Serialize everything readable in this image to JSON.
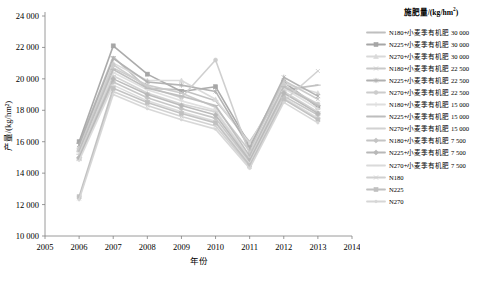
{
  "chart_data": {
    "type": "line",
    "title": "",
    "xlabel": "年份",
    "ylabel": "产量/(kg/hm²)",
    "xlim": [
      2005,
      2014
    ],
    "ylim": [
      10000,
      24000
    ],
    "ytick_labels": [
      "10 000",
      "12 000",
      "14 000",
      "16 000",
      "18 000",
      "20 000",
      "22 000",
      "24 000"
    ],
    "yticks": [
      10000,
      12000,
      14000,
      16000,
      18000,
      20000,
      22000,
      24000
    ],
    "xtick_labels": [
      "2005",
      "2006",
      "2007",
      "2008",
      "2009",
      "2010",
      "2011",
      "2012",
      "2013",
      "2014"
    ],
    "xticks": [
      2005,
      2006,
      2007,
      2008,
      2009,
      2010,
      2011,
      2012,
      2013,
      2014
    ],
    "grid": false,
    "legend_position": "right",
    "legend_title": "施肥量/(kg/hm²)",
    "x": [
      2006,
      2007,
      2008,
      2009,
      2010,
      2011,
      2012,
      2013
    ],
    "series": [
      {
        "name": "N180+小麦季有机肥 30 000",
        "color": "#bfbfbf",
        "marker": "dash",
        "values": [
          15900,
          21400,
          19400,
          19300,
          18600,
          16000,
          19300,
          19600
        ]
      },
      {
        "name": "N225+小麦季有机肥 30 000",
        "color": "#a6a6a6",
        "marker": "square",
        "values": [
          16000,
          22100,
          20300,
          19200,
          19500,
          15800,
          19800,
          18200
        ]
      },
      {
        "name": "N270+小麦季有机肥 30 000",
        "color": "#d9d9d9",
        "marker": "triangle",
        "values": [
          15700,
          21000,
          19900,
          19900,
          18700,
          15900,
          19700,
          19100
        ]
      },
      {
        "name": "N180+小麦季有机肥 22 500",
        "color": "#c9c9c9",
        "marker": "cross",
        "values": [
          15600,
          20700,
          19600,
          19100,
          18200,
          15400,
          19900,
          18700
        ]
      },
      {
        "name": "N225+小麦季有机肥 22 500",
        "color": "#b0b0b0",
        "marker": "star",
        "values": [
          15800,
          21300,
          19800,
          19600,
          19200,
          15600,
          20100,
          18900
        ]
      },
      {
        "name": "N270+小麦季有机肥 22 500",
        "color": "#cccccc",
        "marker": "circle",
        "values": [
          15500,
          20900,
          19500,
          18800,
          21200,
          15200,
          19600,
          18400
        ]
      },
      {
        "name": "N180+小麦季有机肥 15 000",
        "color": "#dedede",
        "marker": "plus",
        "values": [
          15300,
          20400,
          19300,
          18600,
          18000,
          15000,
          19400,
          18100
        ]
      },
      {
        "name": "N225+小麦季有机肥 15 000",
        "color": "#bdbdbd",
        "marker": "dash",
        "values": [
          15400,
          20600,
          19400,
          18900,
          18300,
          15100,
          19500,
          18300
        ]
      },
      {
        "name": "N270+小麦季有机肥 15 000",
        "color": "#d2d2d2",
        "marker": "dash",
        "values": [
          15200,
          20200,
          19100,
          18400,
          17900,
          14900,
          19200,
          17900
        ]
      },
      {
        "name": "N180+小麦季有机肥 7 500",
        "color": "#c4c4c4",
        "marker": "diamond",
        "values": [
          14900,
          19800,
          18800,
          18100,
          17500,
          14700,
          18900,
          17700
        ]
      },
      {
        "name": "N225+小麦季有机肥 7 500",
        "color": "#b8b8b8",
        "marker": "diamond",
        "values": [
          15000,
          20000,
          19000,
          18300,
          17700,
          14800,
          19100,
          17800
        ]
      },
      {
        "name": "N270+小麦季有机肥 7 500",
        "color": "#dadada",
        "marker": "dash",
        "values": [
          14800,
          19600,
          18600,
          17900,
          17300,
          14600,
          18800,
          17500
        ]
      },
      {
        "name": "N180",
        "color": "#d0d0d0",
        "marker": "cross",
        "values": [
          12400,
          19200,
          18300,
          17600,
          17000,
          14400,
          18600,
          20500
        ]
      },
      {
        "name": "N225",
        "color": "#c0c0c0",
        "marker": "square",
        "values": [
          12500,
          19400,
          18500,
          17800,
          17200,
          14500,
          18700,
          17400
        ]
      },
      {
        "name": "N270",
        "color": "#d6d6d6",
        "marker": "dot",
        "values": [
          12300,
          19000,
          18100,
          17400,
          16800,
          14300,
          18500,
          17200
        ]
      }
    ]
  }
}
